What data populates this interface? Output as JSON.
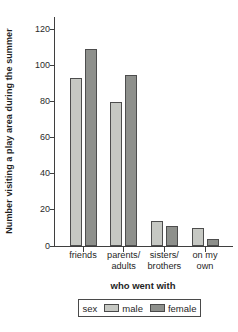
{
  "chart_data": {
    "type": "bar",
    "title": "",
    "ylabel": "Number visiting a play area during the summer",
    "xlabel": "who went with",
    "legend_title": "sex",
    "legend_position": "bottom",
    "grid": false,
    "categories": [
      "friends",
      "parents/\nadults",
      "sisters/\nbrothers",
      "on my\nown"
    ],
    "series": [
      {
        "name": "male",
        "color": "#c6c8c3",
        "values": [
          93,
          80,
          14,
          10
        ]
      },
      {
        "name": "female",
        "color": "#8e908c",
        "values": [
          109,
          95,
          11,
          4
        ]
      }
    ],
    "yticks": [
      0,
      20,
      40,
      60,
      80,
      100,
      120
    ],
    "ylim": [
      0,
      127
    ]
  },
  "colors": {
    "background": "#ffffff",
    "axis": "#3f3f3f",
    "bar_border": "#4d4d4d",
    "text": "#222222"
  }
}
